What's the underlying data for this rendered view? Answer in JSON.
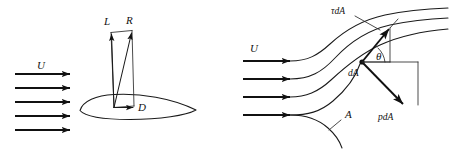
{
  "figure": {
    "background_color": "#ffffff",
    "ink_color": "#111111",
    "panels": [
      {
        "id": "left-panel",
        "name": "airfoil-force-diagram",
        "labels": {
          "freestream": "U",
          "lift": "L",
          "resultant": "R",
          "drag": "D"
        },
        "freestream_arrow_count": 5
      },
      {
        "id": "right-panel",
        "name": "surface-stress-diagram",
        "labels": {
          "freestream": "U",
          "shear_stress": "τdA",
          "area_element": "dA",
          "angle": "θ",
          "pressure_force": "pdA",
          "surface": "A"
        },
        "freestream_arrow_count": 4,
        "streamline_count": 3
      }
    ]
  },
  "left_panel": {
    "freestream_label": "U",
    "lift_label": "L",
    "resultant_label": "R",
    "drag_label": "D"
  },
  "right_panel": {
    "freestream_label": "U",
    "tau_da_label": "τdA",
    "da_label": "dA",
    "theta_label": "θ",
    "p_da_label": "pdA",
    "area_label": "A"
  }
}
